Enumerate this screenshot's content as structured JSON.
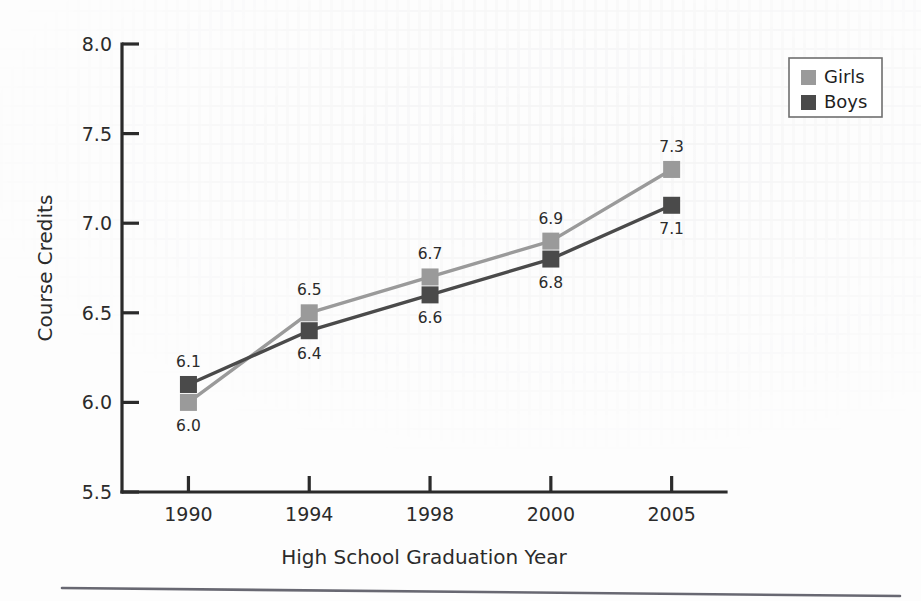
{
  "chart_data": {
    "type": "line",
    "title": "",
    "xlabel": "High School Graduation Year",
    "ylabel": "Course Credits",
    "categories": [
      "1990",
      "1994",
      "1998",
      "2000",
      "2005"
    ],
    "series": [
      {
        "name": "Girls",
        "color": "#9a9a9a",
        "values": [
          6.0,
          6.5,
          6.7,
          6.9,
          7.3
        ],
        "labels": [
          "6.0",
          "6.5",
          "6.7",
          "6.9",
          "7.3"
        ],
        "label_side": [
          "below",
          "above",
          "above",
          "above",
          "above"
        ]
      },
      {
        "name": "Boys",
        "color": "#4a4a4a",
        "values": [
          6.1,
          6.4,
          6.6,
          6.8,
          7.1
        ],
        "labels": [
          "6.1",
          "6.4",
          "6.6",
          "6.8",
          "7.1"
        ],
        "label_side": [
          "above",
          "below",
          "below",
          "below",
          "below"
        ]
      }
    ],
    "ylim": [
      5.5,
      8.0
    ],
    "yticks": [
      5.5,
      6.0,
      6.5,
      7.0,
      7.5,
      8.0
    ],
    "ytick_labels": [
      "5.5",
      "6.0",
      "6.5",
      "7.0",
      "7.5",
      "8.0"
    ],
    "grid": false,
    "legend_position": "top-right",
    "legend_entries": [
      "Girls",
      "Boys"
    ]
  },
  "legend": {
    "entries": [
      {
        "label": "Girls",
        "swatch": "#9a9a9a"
      },
      {
        "label": "Boys",
        "swatch": "#4a4a4a"
      }
    ]
  },
  "axes": {
    "y_title": "Course Credits",
    "x_title": "High School Graduation Year"
  }
}
